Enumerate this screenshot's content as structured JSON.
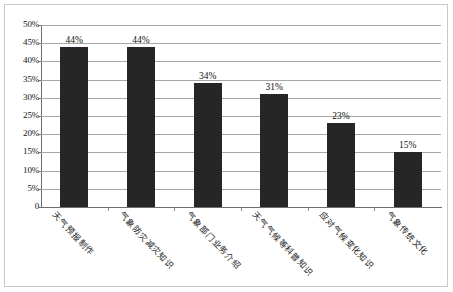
{
  "chart_data": {
    "type": "bar",
    "title": "",
    "subtitle": "",
    "xlabel": "",
    "ylabel": "",
    "categories": [
      "天气预报制作",
      "气象防灾减灾知识",
      "气象部门业务介绍",
      "天气气候等科普知识",
      "应对气候变化知识",
      "气象传统文化"
    ],
    "values": [
      44,
      44,
      34,
      31,
      23,
      15
    ],
    "value_labels": [
      "44%",
      "44%",
      "34%",
      "31%",
      "23%",
      "15%"
    ],
    "ylim": [
      0,
      50
    ],
    "ytick_labels": [
      "0",
      "5%",
      "10%",
      "15%",
      "20%",
      "25%",
      "30%",
      "35%",
      "40%",
      "45%",
      "50%"
    ],
    "ytick_values": [
      0,
      5,
      10,
      15,
      20,
      25,
      30,
      35,
      40,
      45,
      50
    ],
    "grid": true,
    "legend": false,
    "legend_position": "none",
    "series": [
      {
        "name": "",
        "values": [
          44,
          44,
          34,
          31,
          23,
          15
        ]
      }
    ],
    "colors": {
      "bar": "#262626",
      "gridline": "#a6a6a6",
      "axis": "#6e6e6e",
      "frame": "#c9c9c9",
      "background": "#ffffff",
      "text": "#141414"
    }
  }
}
